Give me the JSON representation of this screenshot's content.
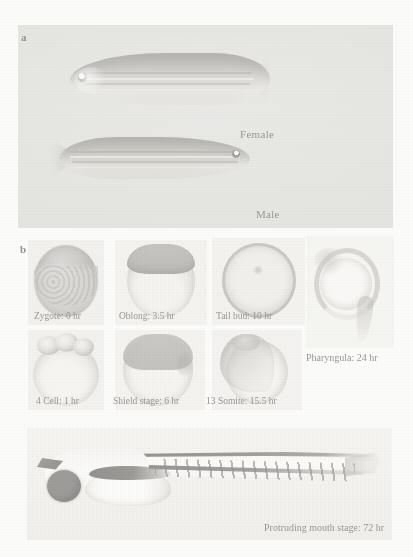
{
  "figure": {
    "panels": [
      {
        "letter": "a",
        "description": "adult zebrafish sexual dimorphism"
      },
      {
        "letter": "b",
        "description": "zebrafish developmental stages"
      }
    ]
  },
  "panel_a": {
    "letter": "a",
    "fish": [
      {
        "label": "Female",
        "name": "female-zebrafish"
      },
      {
        "label": "Male",
        "name": "male-zebrafish"
      }
    ]
  },
  "panel_b": {
    "letter": "b",
    "stages_row1": [
      {
        "label": "Zygote: 0 hr",
        "stage": "Zygote",
        "time": "0 hr"
      },
      {
        "label": "Oblong: 3.5 hr",
        "stage": "Oblong",
        "time": "3.5 hr"
      },
      {
        "label": "Tail bud: 10 hr",
        "stage": "Tail bud",
        "time": "10 hr"
      }
    ],
    "stages_row2": [
      {
        "label": "4 Cell: 1 hr",
        "stage": "4 Cell",
        "time": "1 hr"
      },
      {
        "label": "Shield stage: 6 hr",
        "stage": "Shield stage",
        "time": "6 hr"
      },
      {
        "label": "13 Somite: 15.5 hr",
        "stage": "13 Somite",
        "time": "15.5 hr"
      }
    ],
    "pharyngula": {
      "label": "Pharyngula: 24 hr",
      "stage": "Pharyngula",
      "time": "24 hr"
    },
    "larva": {
      "label": "Protruding mouth stage: 72 hr",
      "stage": "Protruding mouth stage",
      "time": "72 hr"
    }
  },
  "colors": {
    "photo_background": "#cfcfc9",
    "embryo_background": "#e8e7e2",
    "caption_text": "#141210",
    "page_background": "#fbfbfa"
  }
}
